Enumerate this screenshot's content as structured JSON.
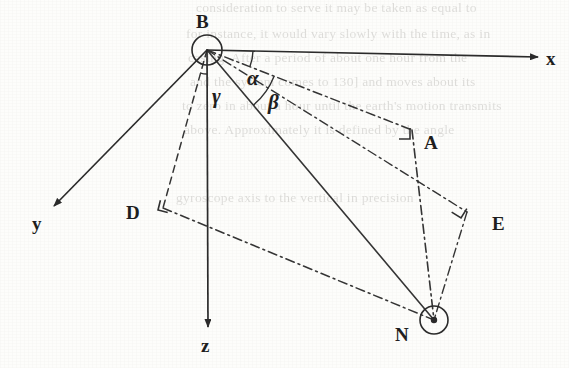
{
  "figure": {
    "kind": "3d-angle-geometry-diagram",
    "background_color": "#fdfdfb",
    "ink_color": "#2a2a2a"
  },
  "points": {
    "B": {
      "label": "B",
      "x": 207,
      "y": 50,
      "marker": "circle",
      "label_x": 196,
      "label_y": 12
    },
    "N": {
      "label": "N",
      "x": 434,
      "y": 320,
      "marker": "circle-dot",
      "label_x": 395,
      "label_y": 325
    },
    "A": {
      "label": "A",
      "x": 412,
      "y": 130,
      "marker": "right-angle",
      "label_x": 424,
      "label_y": 133
    },
    "D": {
      "label": "D",
      "x": 163,
      "y": 208,
      "marker": "right-angle",
      "label_x": 126,
      "label_y": 203
    },
    "E": {
      "label": "E",
      "x": 467,
      "y": 212,
      "marker": "right-angle",
      "label_x": 492,
      "label_y": 214
    }
  },
  "axes": [
    {
      "name": "x-axis",
      "label": "x",
      "from_x": 207,
      "from_y": 50,
      "to_x": 538,
      "to_y": 57,
      "label_x": 546,
      "label_y": 49,
      "style": "solid-arrow"
    },
    {
      "name": "y-axis",
      "label": "y",
      "from_x": 207,
      "from_y": 50,
      "to_x": 54,
      "to_y": 206,
      "label_x": 32,
      "label_y": 214,
      "style": "solid-arrow"
    },
    {
      "name": "z-axis",
      "label": "z",
      "from_x": 207,
      "from_y": 50,
      "to_x": 208,
      "to_y": 327,
      "label_x": 201,
      "label_y": 336,
      "style": "solid-arrow"
    }
  ],
  "angles": [
    {
      "name": "alpha",
      "label": "α",
      "label_x": 247,
      "label_y": 68,
      "vertex": "B",
      "between": [
        "x-axis",
        "BA"
      ]
    },
    {
      "name": "beta",
      "label": "β",
      "label_x": 268,
      "label_y": 92,
      "vertex": "B",
      "between": [
        "BA",
        "BN"
      ]
    },
    {
      "name": "gamma",
      "label": "γ",
      "label_x": 212,
      "label_y": 86,
      "vertex": "B",
      "between": [
        "BD",
        "z-axis"
      ]
    }
  ],
  "segments": [
    {
      "name": "B-to-A",
      "from": "B",
      "to": "A",
      "style": "dash-dot"
    },
    {
      "name": "B-to-E",
      "from": "B",
      "to": "E",
      "style": "dash-dot"
    },
    {
      "name": "B-to-N",
      "from": "B",
      "to": "N",
      "style": "solid"
    },
    {
      "name": "B-to-D",
      "from": "B",
      "to": "D",
      "style": "dashed"
    },
    {
      "name": "D-to-N",
      "from": "D",
      "to": "N",
      "style": "dash-dot"
    },
    {
      "name": "A-to-N",
      "from": "A",
      "to": "N",
      "style": "dash-dot"
    },
    {
      "name": "E-to-N",
      "from": "E",
      "to": "N",
      "style": "dash-dot"
    }
  ],
  "ghost_text": {
    "note": "faint bleed-through text from the reverse page, largely illegible",
    "lines": [
      {
        "text": "consideration to serve it may be taken as equal to",
        "x": 196,
        "y": 6
      },
      {
        "text": "for instance, it would vary slowly with the time, as in",
        "x": 186,
        "y": 32
      },
      {
        "text": "casing. After a period of about one hour from the",
        "x": 188,
        "y": 56
      },
      {
        "text": "and the system comes to 130] and moves about its",
        "x": 190,
        "y": 80
      },
      {
        "text": "to zero in about a hour until the earth's motion transmits",
        "x": 182,
        "y": 104
      },
      {
        "text": "above. Approximately it is defined by the angle",
        "x": 184,
        "y": 128
      },
      {
        "text": "gyroscope axis to the vertical in precision",
        "x": 176,
        "y": 196
      }
    ]
  }
}
